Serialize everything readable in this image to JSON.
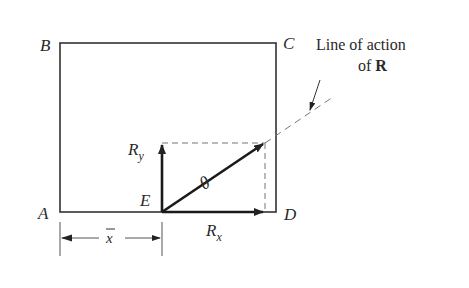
{
  "diagram": {
    "points": {
      "A": "A",
      "B": "B",
      "C": "C",
      "D": "D",
      "E": "E"
    },
    "vectors": {
      "Ry": {
        "main": "R",
        "sub": "y"
      },
      "Rx": {
        "main": "R",
        "sub": "x"
      },
      "R_angle_symbol": "θ"
    },
    "dimension": {
      "label": "x"
    },
    "annotation": {
      "line1": "Line of action",
      "line2_prefix": "of ",
      "line2_bold": "R"
    }
  }
}
